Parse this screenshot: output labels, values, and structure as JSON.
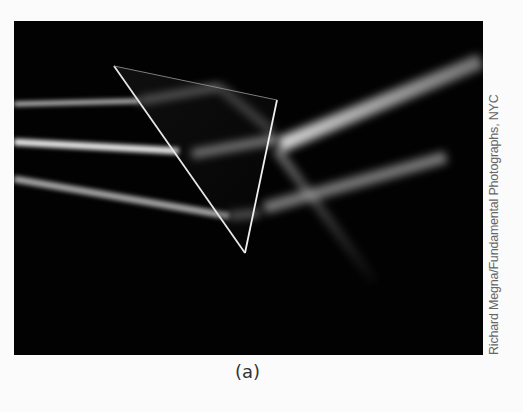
{
  "figure": {
    "label": "(a)",
    "credit": "Richard Megna/Fundamental Photographs, NYC",
    "photo_description": "Three parallel light beams passing through a glass prism on black background, refracting and reflecting",
    "colors": {
      "page_background": "#fbfbfb",
      "photo_background": "#020202",
      "beam": "#d8d8d8",
      "credit_text": "#666666",
      "caption_text": "#333333"
    }
  }
}
